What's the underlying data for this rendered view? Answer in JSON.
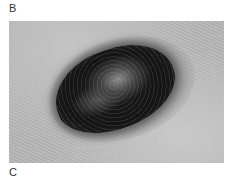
{
  "figure": {
    "panels": [
      {
        "label": "B",
        "content": "clinical photograph of dark pigmented oval skin lesion"
      },
      {
        "label": "C",
        "content": "next panel (cut off)"
      }
    ],
    "image_style": "grayscale"
  }
}
